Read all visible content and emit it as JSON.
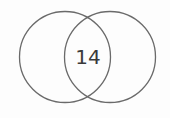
{
  "diagram": {
    "type": "venn",
    "sets": [
      {
        "name": "set-a"
      },
      {
        "name": "set-b"
      }
    ],
    "intersection_label": "14",
    "stroke_color": "#6a6a6a",
    "text_color": "#3a3a3a"
  }
}
